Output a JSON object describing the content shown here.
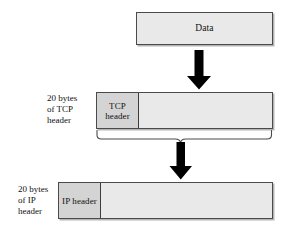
{
  "figure": {
    "background_color": "#ffffff",
    "box_fill": "#e9e9e9",
    "header_fill": "#d4d4d4",
    "border_color": "#4a4a4a",
    "arrow_color": "#000000"
  },
  "data_block": {
    "label": "Data"
  },
  "tcp_row": {
    "side_note": "20 bytes\nof TCP\nheader",
    "header_label": "TCP\nheader",
    "payload_label": ""
  },
  "ip_row": {
    "side_note": "20 bytes\nof IP\nheader",
    "header_label": "IP\nheader",
    "payload_label": ""
  },
  "arrows": {
    "data_to_tcp": "down-arrow",
    "tcp_to_ip": "down-arrow"
  },
  "brace": {
    "name": "tcp-segment-brace"
  }
}
